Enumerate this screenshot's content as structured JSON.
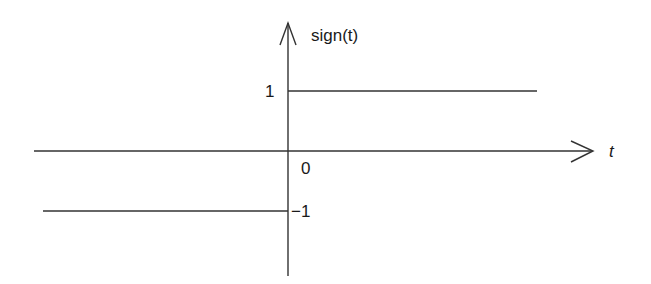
{
  "diagram": {
    "y_axis_label": "sign(t)",
    "x_axis_label": "t",
    "origin_label": "0",
    "tick_labels": {
      "positive": "1",
      "negative": "−1"
    },
    "colors": {
      "line": "#333333",
      "text": "#1a1a1a",
      "background": "#ffffff"
    },
    "segments": [
      {
        "name": "positive-branch",
        "value": 1,
        "domain": "t > 0"
      },
      {
        "name": "negative-branch",
        "value": -1,
        "domain": "t < 0"
      }
    ]
  }
}
